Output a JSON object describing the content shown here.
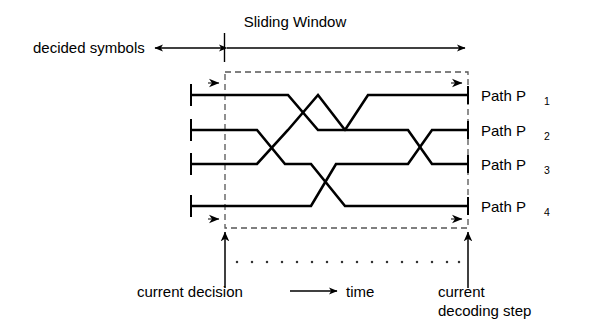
{
  "figure": {
    "type": "trellis-sliding-window-diagram",
    "title_top": "Sliding Window",
    "label_decided_symbols": "decided symbols",
    "label_time": "time",
    "label_current_decision": "current decision",
    "label_current_decoding_step_line1": "current",
    "label_current_decoding_step_line2": "decoding step",
    "paths": [
      {
        "name": "Path P",
        "subscript": "1"
      },
      {
        "name": "Path P",
        "subscript": "2"
      },
      {
        "name": "Path P",
        "subscript": "3"
      },
      {
        "name": "Path P",
        "subscript": "4"
      }
    ],
    "colors": {
      "line": "#000000",
      "dashed": "#555555",
      "background": "#ffffff",
      "text": "#000000"
    },
    "geometry": {
      "window_left_x": 225,
      "window_right_x": 468,
      "window_top_y": 72,
      "window_bottom_y": 228,
      "row_y": [
        95,
        130,
        164,
        206
      ],
      "trellis_start_x": 191,
      "trellis_end_x": 468,
      "sliding_window_arrow_y": 48,
      "decided_symbols_arrow_left_x": 152,
      "dotted_time_row_y": 262,
      "dot_count": 16
    }
  }
}
